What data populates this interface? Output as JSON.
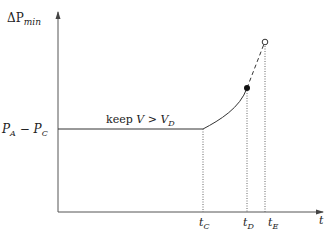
{
  "diagram": {
    "y_axis_label": {
      "main": "ΔP",
      "sub": "min"
    },
    "x_axis_label": "t",
    "level_label": {
      "a": "P",
      "a_sub": "A",
      "minus": " − ",
      "b": "P",
      "b_sub": "C"
    },
    "segment_label": {
      "keep": "keep ",
      "v": "V",
      "gt": " > ",
      "vd": "V",
      "vd_sub": "D"
    },
    "ticks": [
      {
        "main": "t",
        "sub": "C"
      },
      {
        "main": "t",
        "sub": "D"
      },
      {
        "main": "t",
        "sub": "E"
      }
    ],
    "colors": {
      "line": "#333333",
      "axis": "#555555",
      "dotted": "#666666"
    }
  }
}
